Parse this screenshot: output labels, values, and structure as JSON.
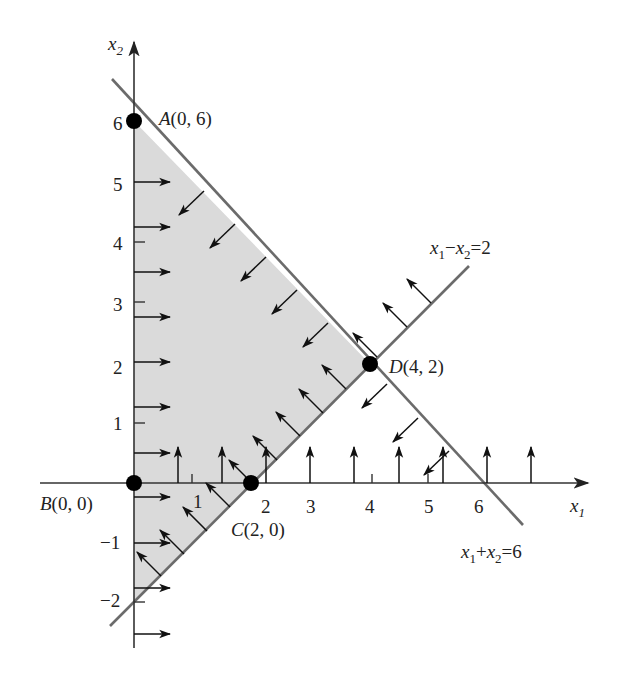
{
  "figure": {
    "type": "linear-program-feasible-region",
    "axes": {
      "x_label": "x",
      "x_label_sub": "1",
      "y_label": "x",
      "y_label_sub": "2",
      "x_ticks": [
        "1",
        "2",
        "3",
        "4",
        "5",
        "6"
      ],
      "y_ticks": [
        "6",
        "5",
        "4",
        "3",
        "2",
        "1",
        "−1",
        "−2"
      ]
    },
    "points": [
      {
        "name": "A",
        "label": "A(0, 6)",
        "x": 0,
        "y": 6
      },
      {
        "name": "B",
        "label": "B(0, 0)",
        "x": 0,
        "y": 0
      },
      {
        "name": "C",
        "label": "C(2, 0)",
        "x": 2,
        "y": 0
      },
      {
        "name": "D",
        "label": "D(4, 2)",
        "x": 4,
        "y": 2
      }
    ],
    "constraints": [
      {
        "id": "sum",
        "label_parts": [
          "x",
          "1",
          "+",
          "x",
          "2",
          "=6"
        ],
        "text": "x1 + x2 = 6"
      },
      {
        "id": "diff",
        "label_parts": [
          "x",
          "1",
          "−",
          "x",
          "2",
          "=2"
        ],
        "text": "x1 − x2 = 2"
      }
    ],
    "colors": {
      "region_fill": "#d9d9d9",
      "line": "#6b6b6b",
      "axis": "#3a3a3a",
      "arrow": "#111111",
      "point": "#000000"
    }
  }
}
